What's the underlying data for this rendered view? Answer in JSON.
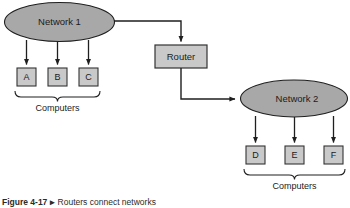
{
  "figure": {
    "caption_label": "Figure 4-17",
    "caption_separator": "▸",
    "caption_text": "Routers connect networks"
  },
  "diagram": {
    "type": "network-topology",
    "nodes": [
      {
        "id": "network1",
        "shape": "ellipse",
        "label": "Network 1",
        "cx": 59.5,
        "cy": 22,
        "rx": 55.5,
        "ry": 20
      },
      {
        "id": "router",
        "shape": "rect",
        "label": "Router",
        "x": 155,
        "y": 45,
        "w": 52,
        "h": 23
      },
      {
        "id": "network2",
        "shape": "ellipse",
        "label": "Network 2",
        "cx": 294,
        "cy": 98.5,
        "rx": 54,
        "ry": 18.5
      },
      {
        "id": "hostA",
        "shape": "rect",
        "label": "A",
        "x": 17,
        "y": 68,
        "w": 19,
        "h": 18
      },
      {
        "id": "hostB",
        "shape": "rect",
        "label": "B",
        "x": 48,
        "y": 68,
        "w": 19,
        "h": 18
      },
      {
        "id": "hostC",
        "shape": "rect",
        "label": "C",
        "x": 79,
        "y": 68,
        "w": 19,
        "h": 18
      },
      {
        "id": "hostD",
        "shape": "rect",
        "label": "D",
        "x": 246,
        "y": 146,
        "w": 19,
        "h": 18
      },
      {
        "id": "hostE",
        "shape": "rect",
        "label": "E",
        "x": 285,
        "y": 146,
        "w": 19,
        "h": 18
      },
      {
        "id": "hostF",
        "shape": "rect",
        "label": "F",
        "x": 324,
        "y": 146,
        "w": 19,
        "h": 18
      }
    ],
    "groups": [
      {
        "id": "computers-left",
        "label": "Computers",
        "label_x": 57.5,
        "label_y": 110
      },
      {
        "id": "computers-right",
        "label": "Computers",
        "label_x": 295,
        "label_y": 188
      }
    ],
    "edges": [
      {
        "from": "network1",
        "to": "hostA",
        "arrow": true
      },
      {
        "from": "network1",
        "to": "hostB",
        "arrow": true
      },
      {
        "from": "network1",
        "to": "hostC",
        "arrow": true
      },
      {
        "from": "network1",
        "to": "router",
        "arrow": true,
        "style": "orthogonal"
      },
      {
        "from": "router",
        "to": "network2",
        "arrow": true,
        "style": "orthogonal"
      },
      {
        "from": "network2",
        "to": "hostD",
        "arrow": true
      },
      {
        "from": "network2",
        "to": "hostE",
        "arrow": true
      },
      {
        "from": "network2",
        "to": "hostF",
        "arrow": true
      }
    ]
  },
  "colors": {
    "cloud_fill": "#a8a8a8",
    "cloud_stroke": "#1f1f1f",
    "box_fill": "#c9c9c9",
    "box_stroke": "#333333",
    "line": "#1f1f1f",
    "text": "#1b1b1b",
    "page_background": "#ffffff"
  }
}
